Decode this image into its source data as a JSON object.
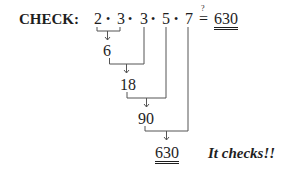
{
  "label": "CHECK:",
  "expression": {
    "factors": [
      "2",
      "3",
      "3",
      "5",
      "7"
    ],
    "operator": "•",
    "relation": "=",
    "relation_mark": "?",
    "target": "630"
  },
  "steps": [
    {
      "value": "6",
      "from": "2 • 3"
    },
    {
      "value": "18",
      "from": "6 • 3"
    },
    {
      "value": "90",
      "from": "18 • 5"
    },
    {
      "value": "630",
      "from": "90 • 7"
    }
  ],
  "conclusion": "It checks!!",
  "colors": {
    "ink": "#1e1e1e",
    "background": "#ffffff"
  }
}
